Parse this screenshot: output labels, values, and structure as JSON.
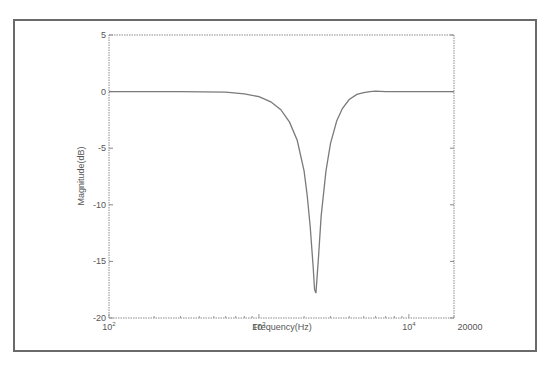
{
  "chart_data": {
    "type": "line",
    "title": "",
    "xlabel": "Frequency(Hz)",
    "ylabel": "Magnitude(dB)",
    "xscale": "log",
    "xlim": [
      100,
      20000
    ],
    "ylim": [
      -20,
      5
    ],
    "grid": false,
    "legend": null,
    "x_ticks": [
      {
        "value": 100,
        "base": "10",
        "exp": "2"
      },
      {
        "value": 1000,
        "base": "10",
        "exp": "3"
      },
      {
        "value": 10000,
        "base": "10",
        "exp": "4"
      },
      {
        "value": 20000,
        "label": "20000"
      }
    ],
    "y_ticks": [
      5,
      0,
      -5,
      -10,
      -15,
      -20
    ],
    "series": [
      {
        "name": "notch filter response",
        "color": "#7a7a7a",
        "x": [
          100,
          300,
          600,
          800,
          1000,
          1200,
          1400,
          1600,
          1800,
          2000,
          2100,
          2200,
          2300,
          2350,
          2400,
          2500,
          2600,
          2800,
          3000,
          3300,
          3600,
          4000,
          4500,
          5000,
          5500,
          6000,
          7000,
          8000,
          10000,
          20000
        ],
        "y": [
          0,
          0,
          -0.05,
          -0.2,
          -0.45,
          -0.9,
          -1.6,
          -2.7,
          -4.3,
          -7.0,
          -9.2,
          -12.0,
          -15.5,
          -17.5,
          -17.8,
          -14.5,
          -11.0,
          -7.0,
          -4.6,
          -2.6,
          -1.5,
          -0.7,
          -0.25,
          -0.1,
          0.0,
          0.05,
          0.0,
          0.0,
          0.0,
          0.0
        ]
      }
    ]
  },
  "labels": {
    "xlabel": "Frequency(Hz)",
    "ylabel": "Magnitude(dB)",
    "x_last": "20000"
  }
}
